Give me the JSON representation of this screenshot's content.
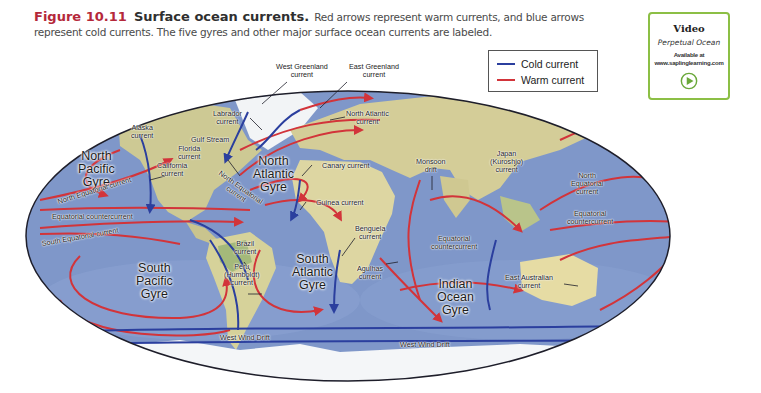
{
  "caption": {
    "figure_number": "Figure 10.11",
    "figure_title": "Surface ocean currents.",
    "text": "Red arrows represent warm currents, and blue arrows represent cold currents. The five gyres and other major surface ocean currents are labeled."
  },
  "video_box": {
    "heading": "Video",
    "name": "Perpetual Ocean",
    "availability_line1": "Available at",
    "availability_line2": "www.saplinglearning.com",
    "play_icon": "play-circle-icon",
    "accent_color": "#8cbf45"
  },
  "legend": {
    "items": [
      {
        "label": "Cold current",
        "color": "#2b3f9e"
      },
      {
        "label": "Warm current",
        "color": "#d2343a"
      }
    ]
  },
  "colors": {
    "ocean": "#7f97c9",
    "land": "#d9cf9a",
    "ice": "#f4f6f8",
    "warm": "#d2343a",
    "cold": "#2b3f9e",
    "outline": "#1e1e2a"
  },
  "gyres": {
    "north_pacific": [
      "North",
      "Pacific",
      "Gyre"
    ],
    "north_atlantic": [
      "North",
      "Atlantic",
      "Gyre"
    ],
    "south_pacific": [
      "South",
      "Pacific",
      "Gyre"
    ],
    "south_atlantic": [
      "South",
      "Atlantic",
      "Gyre"
    ],
    "indian_ocean": [
      "Indian",
      "Ocean",
      "Gyre"
    ]
  },
  "currents": {
    "west_greenland": [
      "West Greenland",
      "current"
    ],
    "east_greenland": [
      "East Greenland",
      "current"
    ],
    "labrador": [
      "Labrador",
      "current"
    ],
    "north_atlantic": [
      "North Atlantic",
      "current"
    ],
    "alaska": [
      "Alaska",
      "current"
    ],
    "gulf_stream": "Gulf Stream",
    "florida": [
      "Florida",
      "current"
    ],
    "california": [
      "California",
      "current"
    ],
    "canary": "Canary current",
    "north_equatorial_atlantic": [
      "North Equatorial",
      "current"
    ],
    "north_equatorial_pacific_west": "North Equatorial current",
    "monsoon_drift": [
      "Monsoon",
      "drift"
    ],
    "japan_kuroshio": [
      "Japan",
      "(Kuroshio)",
      "current"
    ],
    "north_equatorial_pacific_east": [
      "North",
      "Equatorial",
      "current"
    ],
    "equatorial_countercurrent_pacific_east": [
      "Equatorial",
      "countercurrent"
    ],
    "equatorial_countercurrent_west": "Equatorial countercurrent",
    "south_equatorial": "South Equatorial current",
    "guinea": "Guinea current",
    "brazil": [
      "Brazil",
      "current"
    ],
    "peru_humboldt": [
      "Peru",
      "(Humboldt)",
      "current"
    ],
    "benguela": [
      "Benguela",
      "current"
    ],
    "agulhas": [
      "Agulhas",
      "current"
    ],
    "equatorial_countercurrent_indian": [
      "Equatorial",
      "countercurrent"
    ],
    "east_australian": [
      "East Australian",
      "current"
    ],
    "west_wind_drift_1": "West Wind Drift",
    "west_wind_drift_2": "West Wind Drift"
  }
}
